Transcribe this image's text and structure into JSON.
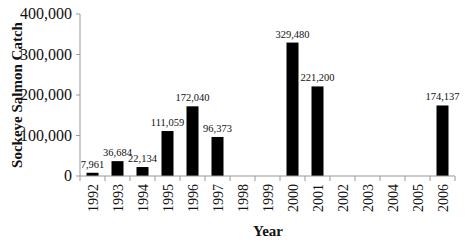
{
  "chart_data": {
    "type": "bar",
    "title": "",
    "xlabel": "Year",
    "ylabel": "Sockeye Salmon Catch",
    "ylim": [
      0,
      400000
    ],
    "yticks": [
      0,
      100000,
      200000,
      300000,
      400000
    ],
    "ytick_labels": [
      "0",
      "100,000",
      "200,000",
      "300,000",
      "400,000"
    ],
    "grid": false,
    "legend": null,
    "categories": [
      "1992",
      "1993",
      "1994",
      "1995",
      "1996",
      "1997",
      "1998",
      "1999",
      "2000",
      "2001",
      "2002",
      "2003",
      "2004",
      "2005",
      "2006"
    ],
    "values": [
      7961,
      36684,
      22134,
      111059,
      172040,
      96373,
      null,
      null,
      329480,
      221200,
      null,
      null,
      null,
      null,
      174137
    ],
    "data_labels": [
      "7,961",
      "36,684",
      "22,134",
      "111,059",
      "172,040",
      "96,373",
      "",
      "",
      "329,480",
      "221,200",
      "",
      "",
      "",
      "",
      "174,137"
    ],
    "bar_color": "#000000"
  }
}
